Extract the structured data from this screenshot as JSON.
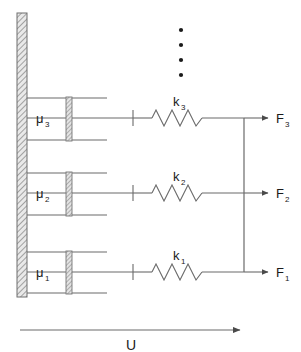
{
  "figure": {
    "type": "mechanical-analog-diagram",
    "width": 301,
    "height": 352,
    "background_color": "#ffffff",
    "line_color": "#555555",
    "text_color": "#1a1a1a",
    "hatch_color": "#8a8a8a"
  },
  "wall": {
    "name": "fixed-wall",
    "x": 17,
    "y": 13,
    "width": 10,
    "height": 284,
    "fill_pattern": "diagonal-hatch",
    "fill_color": "#d8d8d8"
  },
  "branches": [
    {
      "index": 3,
      "damper_label": "μ",
      "damper_sub": "3",
      "spring_label": "k",
      "spring_sub": "3",
      "force_label": "F",
      "force_sub": "3",
      "axis_y": 118,
      "cylinder_top_y": 98,
      "cylinder_bottom_y": 140,
      "cylinder_right_x": 107,
      "piston_x": 66,
      "piston_width": 6,
      "tick_x": 133,
      "spring_start_x": 150,
      "spring_end_x": 205,
      "bar_x": 244,
      "arrow_tip_x": 268,
      "label_x": 277
    },
    {
      "index": 2,
      "damper_label": "μ",
      "damper_sub": "2",
      "spring_label": "k",
      "spring_sub": "2",
      "force_label": "F",
      "force_sub": "2",
      "axis_y": 193,
      "cylinder_top_y": 173,
      "cylinder_bottom_y": 215,
      "cylinder_right_x": 107,
      "piston_x": 66,
      "piston_width": 6,
      "tick_x": 133,
      "spring_start_x": 150,
      "spring_end_x": 205,
      "bar_x": 244,
      "arrow_tip_x": 268,
      "label_x": 277
    },
    {
      "index": 1,
      "damper_label": "μ",
      "damper_sub": "1",
      "spring_label": "k",
      "spring_sub": "1",
      "force_label": "F",
      "force_sub": "1",
      "axis_y": 272,
      "cylinder_top_y": 252,
      "cylinder_bottom_y": 293,
      "cylinder_right_x": 107,
      "piston_x": 66,
      "piston_width": 6,
      "tick_x": 133,
      "spring_start_x": 150,
      "spring_end_x": 205,
      "bar_x": 244,
      "arrow_tip_x": 268,
      "label_x": 277
    }
  ],
  "continuation_dots": {
    "name": "vertical-ellipsis",
    "count": 4,
    "x": 181,
    "y_values": [
      30,
      45,
      60,
      75
    ],
    "radius": 2.1
  },
  "connector_bar": {
    "name": "rigid-connector-bar",
    "x": 244,
    "y_top": 118,
    "y_bottom": 272
  },
  "displacement": {
    "name": "displacement-arrow",
    "label": "U",
    "x_start": 20,
    "x_end": 240,
    "y": 330,
    "label_x": 131,
    "label_y": 350
  },
  "labels": {
    "damper_symbol": "μ",
    "spring_symbol": "k",
    "force_symbol": "F",
    "displacement_symbol": "U"
  }
}
